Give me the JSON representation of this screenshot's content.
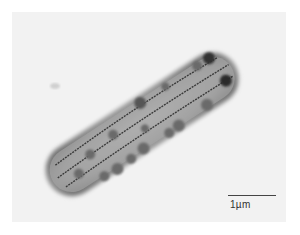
{
  "image": {
    "kind": "transmission electron micrograph",
    "subject": "rod-shaped bacterial cell with intracellular granules and membrane stacks",
    "background_color": "#f2f2f2",
    "cell_color": "#8a8a8a"
  },
  "scale_bar": {
    "label": "1µm"
  }
}
